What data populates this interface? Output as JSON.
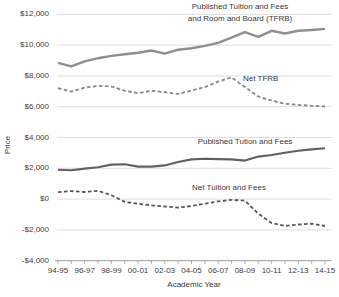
{
  "figure": {
    "annotations": {
      "tfrb_line1": "Published Tuition and Fees",
      "tfrb_line2": "and Room and Board (TFRB)",
      "net_tfrb": "Net TFRB",
      "published_tf": "Published Tution and Fees",
      "net_tf": "Net Tuition and Fees"
    }
  },
  "chart_data": {
    "type": "line",
    "title": "",
    "xlabel": "Academic Year",
    "ylabel": "Price",
    "ylim": [
      -4000,
      12000
    ],
    "grid": true,
    "legend_position": "inline-annotations",
    "categories": [
      "94-95",
      "95-96",
      "96-97",
      "97-98",
      "98-99",
      "99-00",
      "00-01",
      "01-02",
      "02-03",
      "03-04",
      "04-05",
      "05-06",
      "06-07",
      "07-08",
      "08-09",
      "09-10",
      "10-11",
      "11-12",
      "12-13",
      "13-14",
      "14-15"
    ],
    "x_labeled_ticks": [
      "94-95",
      "96-97",
      "98-99",
      "00-01",
      "02-03",
      "04-05",
      "06-07",
      "08-09",
      "10-11",
      "12-13",
      "14-15"
    ],
    "y_ticks": [
      {
        "value": 12000,
        "label": "$12,000"
      },
      {
        "value": 10000,
        "label": "$10,000"
      },
      {
        "value": 8000,
        "label": "$8,000"
      },
      {
        "value": 6000,
        "label": "$6,000"
      },
      {
        "value": 4000,
        "label": "$4,000"
      },
      {
        "value": 2000,
        "label": "$2,000"
      },
      {
        "value": 0,
        "label": "$0"
      },
      {
        "value": -2000,
        "label": "-$2,000"
      },
      {
        "value": -4000,
        "label": "-$4,000"
      }
    ],
    "series": [
      {
        "name": "Published Tuition and Fees and Room and Board (TFRB)",
        "slug": "published-tfrb",
        "style": "solid",
        "color": "#8f8f8f",
        "width": 2.4,
        "values": [
          8850,
          8620,
          8950,
          9150,
          9300,
          9400,
          9500,
          9650,
          9450,
          9700,
          9800,
          9950,
          10150,
          10490,
          10840,
          10530,
          10930,
          10750,
          10930,
          10980,
          11050
        ]
      },
      {
        "name": "Net TFRB",
        "slug": "net-tfrb",
        "style": "dashed",
        "color": "#878787",
        "width": 1.8,
        "values": [
          7200,
          6980,
          7240,
          7350,
          7310,
          7030,
          6880,
          7030,
          6940,
          6830,
          7050,
          7270,
          7630,
          7910,
          7270,
          6660,
          6400,
          6190,
          6120,
          6060,
          6020
        ]
      },
      {
        "name": "Published Tution and Fees",
        "slug": "published-tuition-fees",
        "style": "solid",
        "color": "#616161",
        "width": 2.1,
        "values": [
          1900,
          1870,
          1980,
          2070,
          2240,
          2260,
          2110,
          2110,
          2190,
          2410,
          2580,
          2625,
          2600,
          2580,
          2500,
          2760,
          2865,
          3015,
          3145,
          3230,
          3300
        ]
      },
      {
        "name": "Net Tuition and Fees",
        "slug": "net-tuition-fees",
        "style": "dashed",
        "color": "#575757",
        "width": 1.8,
        "values": [
          450,
          520,
          460,
          540,
          250,
          -180,
          -300,
          -400,
          -480,
          -550,
          -450,
          -300,
          -150,
          -50,
          -100,
          -950,
          -1550,
          -1750,
          -1650,
          -1600,
          -1750
        ]
      }
    ]
  }
}
